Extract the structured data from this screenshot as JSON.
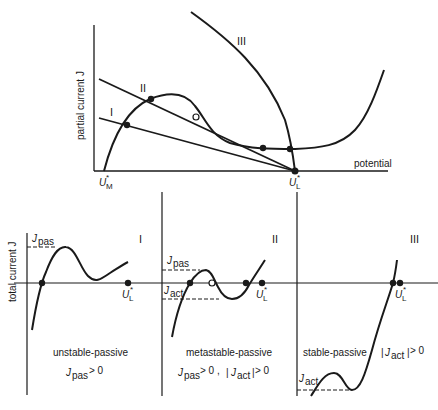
{
  "top_plot": {
    "y_axis_label": "partial current J",
    "x_axis_label": "potential",
    "x_markers": {
      "U_M": {
        "main": "U",
        "sub": "M",
        "sup": "*"
      },
      "U_L": {
        "main": "U",
        "sub": "L",
        "sup": "*"
      }
    },
    "curve_labels": [
      "I",
      "II",
      "III"
    ]
  },
  "bottom_panels": {
    "y_axis_label": "total current J",
    "panels": [
      {
        "roman": "I",
        "title": "unstable-passive",
        "condition": "J_pas > 0",
        "cond_parts": {
          "j": "J",
          "sub": "pas",
          "rest": " > 0"
        },
        "level_labels": [
          {
            "j": "J",
            "sub": "pas"
          }
        ],
        "marker": {
          "main": "U",
          "sub": "L",
          "sup": "*"
        }
      },
      {
        "roman": "II",
        "title": "metastable-passive",
        "condition": "J_pas > 0 , |J_act| > 0",
        "cond_parts": {
          "j": "J",
          "sub": "pas",
          "rest": " > 0  ,",
          "abs_open": "|",
          "j2": "J",
          "sub2": "act",
          "abs_close": "|",
          "rest2": " > 0"
        },
        "level_labels": [
          {
            "j": "J",
            "sub": "pas"
          },
          {
            "j": "J",
            "sub": "act"
          }
        ],
        "marker": {
          "main": "U",
          "sub": "L",
          "sup": "*"
        }
      },
      {
        "roman": "III",
        "title": "stable-passive",
        "condition": "|J_act| > 0",
        "cond_parts": {
          "abs_open": "|",
          "j": "J",
          "sub": "act",
          "abs_close": "|",
          "rest": " > 0"
        },
        "level_labels": [
          {
            "j": "J",
            "sub": "act"
          }
        ],
        "marker": {
          "main": "U",
          "sub": "L",
          "sup": "*"
        }
      }
    ]
  },
  "colors": {
    "ink": "#1a1a1a",
    "background": "#ffffff"
  }
}
